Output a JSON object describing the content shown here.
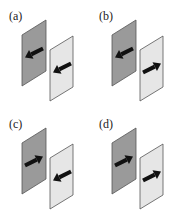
{
  "figure": {
    "panels": [
      {
        "id": "a",
        "label": "(a)",
        "left_plate_arrow": "left",
        "right_plate_arrow": "left"
      },
      {
        "id": "b",
        "label": "(b)",
        "left_plate_arrow": "left",
        "right_plate_arrow": "right"
      },
      {
        "id": "c",
        "label": "(c)",
        "left_plate_arrow": "right",
        "right_plate_arrow": "left"
      },
      {
        "id": "d",
        "label": "(d)",
        "left_plate_arrow": "right",
        "right_plate_arrow": "right"
      }
    ],
    "colors": {
      "dark_plate": "#9a9a9a",
      "light_plate": "#e6e6e6",
      "edge": "#555555",
      "arrow": "#111111"
    }
  }
}
